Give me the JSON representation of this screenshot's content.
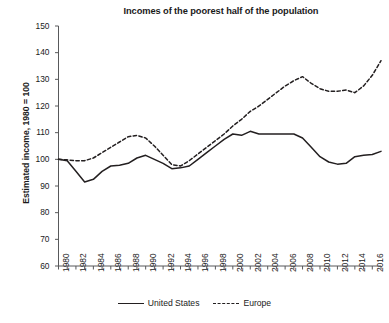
{
  "chart_data": {
    "type": "line",
    "title": "Incomes of the poorest half of the population",
    "xlabel": "",
    "ylabel": "Estimated income, 1980 = 100",
    "ylim": [
      60,
      150
    ],
    "ytick_step": 10,
    "yticks": [
      60,
      70,
      80,
      90,
      100,
      110,
      120,
      130,
      140,
      150
    ],
    "xlim": [
      1980,
      2017
    ],
    "xticks": [
      1980,
      1981,
      1982,
      1983,
      1984,
      1985,
      1986,
      1987,
      1988,
      1989,
      1990,
      1991,
      1992,
      1993,
      1994,
      1995,
      1996,
      1997,
      1998,
      1999,
      2000,
      2001,
      2002,
      2003,
      2004,
      2005,
      2006,
      2007,
      2008,
      2009,
      2010,
      2011,
      2012,
      2013,
      2014,
      2015,
      2016,
      2017
    ],
    "xtick_labels": [
      "1980",
      "1982",
      "1984",
      "1986",
      "1988",
      "1990",
      "1992",
      "1994",
      "1996",
      "1998",
      "2000",
      "2002",
      "2004",
      "2006",
      "2008",
      "2010",
      "2012",
      "2014",
      "2016"
    ],
    "xtick_label_years": [
      1980,
      1982,
      1984,
      1986,
      1988,
      1990,
      1992,
      1994,
      1996,
      1998,
      2000,
      2002,
      2004,
      2006,
      2008,
      2010,
      2012,
      2014,
      2016
    ],
    "grid": false,
    "legend_position": "bottom",
    "x": [
      1980,
      1981,
      1982,
      1983,
      1984,
      1985,
      1986,
      1987,
      1988,
      1989,
      1990,
      1991,
      1992,
      1993,
      1994,
      1995,
      1996,
      1997,
      1998,
      1999,
      2000,
      2001,
      2002,
      2003,
      2004,
      2005,
      2006,
      2007,
      2008,
      2009,
      2010,
      2011,
      2012,
      2013,
      2014,
      2015,
      2016,
      2017
    ],
    "series": [
      {
        "name": "United States",
        "style": "solid",
        "color": "#231f20",
        "values": [
          100,
          99.5,
          95.5,
          91.5,
          92.5,
          95.5,
          97.5,
          97.8,
          98.5,
          100.5,
          101.5,
          100,
          98.5,
          96.5,
          96.8,
          97.5,
          100,
          102.5,
          105,
          107.5,
          109.5,
          109,
          110.5,
          109.5,
          109.5,
          109.5,
          109.5,
          109.5,
          108,
          104.5,
          101,
          99,
          98.2,
          98.5,
          101,
          101.5,
          101.8,
          103
        ]
      },
      {
        "name": "Europe",
        "style": "dashed",
        "color": "#231f20",
        "values": [
          100,
          99.8,
          99.5,
          99.5,
          100.5,
          102.5,
          104.5,
          106.5,
          108.5,
          109,
          108,
          105,
          101.5,
          98,
          97.5,
          99.5,
          102,
          104.5,
          107,
          109.5,
          112.5,
          115,
          118,
          120,
          122.5,
          125,
          127.5,
          129.5,
          131,
          128.5,
          126.5,
          125.5,
          125.5,
          126,
          125,
          127.5,
          131.5,
          137
        ]
      }
    ]
  },
  "legend": {
    "items": [
      {
        "label": "United States",
        "style": "solid"
      },
      {
        "label": "Europe",
        "style": "dashed"
      }
    ]
  }
}
